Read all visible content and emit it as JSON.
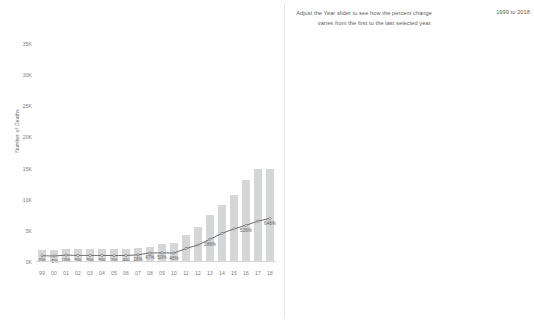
{
  "header": {
    "instruction": "Adjust the Year slider to see how the percent change varies from the first to the last selected year.",
    "range_label": "1999 to 2018"
  },
  "colors": {
    "bar": "#d4d6d8",
    "line": "#6e6e6e",
    "text": "#5f5f5f",
    "axis": "#7a7a7a"
  },
  "chart_data": [
    {
      "type": "bar",
      "id": "left-chart",
      "title": "",
      "xlabel": "",
      "ylabel": "Number of Deaths",
      "categories": [
        "99",
        "00",
        "01",
        "02",
        "03",
        "04",
        "05",
        "06",
        "07",
        "08",
        "09",
        "10",
        "11",
        "12",
        "13",
        "14",
        "15",
        "16",
        "17",
        "18"
      ],
      "values": [
        1960,
        1970,
        2160,
        2060,
        2060,
        2060,
        2010,
        2040,
        2280,
        2450,
        2880,
        3130,
        4400,
        5700,
        7550,
        9200,
        10700,
        13100,
        15000,
        15000
      ],
      "ylim": [
        0,
        35000
      ],
      "yticks": [
        0,
        5000,
        10000,
        15000,
        20000,
        25000,
        30000,
        35000
      ],
      "ytick_labels": [
        "0K",
        "5K",
        "10K",
        "15K",
        "20K",
        "25K",
        "30K",
        "35K"
      ],
      "grid": false,
      "legend": "none",
      "overlay": {
        "type": "line",
        "name": "Percent change",
        "values": [
          0,
          -5,
          10,
          5,
          5,
          5,
          2,
          4,
          16,
          47,
          50,
          46,
          124,
          186,
          286,
          386,
          466,
          526,
          600,
          646
        ],
        "labels": [
          "0%",
          "-5%",
          "10%",
          "5%",
          "5%",
          "5%",
          "2%",
          "4%",
          "16%",
          "47%",
          "50%",
          "46%",
          "",
          "",
          "286%",
          "",
          "",
          "526%",
          "",
          "646%"
        ]
      }
    },
    {
      "type": "bar",
      "id": "right-chart",
      "title": "",
      "xlabel": "",
      "ylabel": "",
      "categories": [
        "99",
        "00",
        "01",
        "02",
        "03",
        "04",
        "05",
        "06",
        "07",
        "08",
        "09",
        "10",
        "11",
        "12",
        "13",
        "14",
        "15",
        "16",
        "17",
        "18"
      ],
      "values": [
        250,
        270,
        330,
        440,
        480,
        530,
        520,
        560,
        570,
        560,
        570,
        560,
        600,
        640,
        790,
        1250,
        2300,
        4450,
        6500,
        7200
      ],
      "ylim": [
        0,
        7800
      ],
      "yticks": [],
      "ytick_labels": [],
      "grid": false,
      "legend": "none",
      "overlay": {
        "type": "line",
        "name": "Percent change",
        "values": [
          0,
          7,
          33,
          76,
          92,
          110,
          110,
          115,
          118,
          113,
          115,
          112,
          125,
          135,
          320,
          600,
          1200,
          2500,
          3700,
          4100
        ],
        "labels": [
          "0%",
          "7%",
          "33%",
          "76%",
          "92%",
          "139%",
          "",
          "",
          "",
          "110%",
          "",
          "",
          "",
          "110%",
          "324%",
          "",
          "1,207%",
          "2,544%",
          "3,753%",
          "4,174%"
        ]
      }
    }
  ]
}
